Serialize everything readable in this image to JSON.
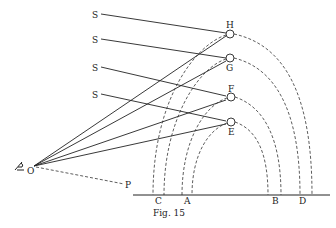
{
  "figure": {
    "caption": "Fig. 15",
    "labels": {
      "S1": "S",
      "S2": "S",
      "S3": "S",
      "S4": "S",
      "H": "H",
      "G": "G",
      "F": "F",
      "E": "E",
      "O": "O",
      "P": "P",
      "C": "C",
      "A": "A",
      "B": "B",
      "D": "D"
    },
    "icons": {
      "eye": "eye-icon"
    },
    "colors": {
      "ink": "#222222",
      "background": "#ffffff"
    }
  }
}
